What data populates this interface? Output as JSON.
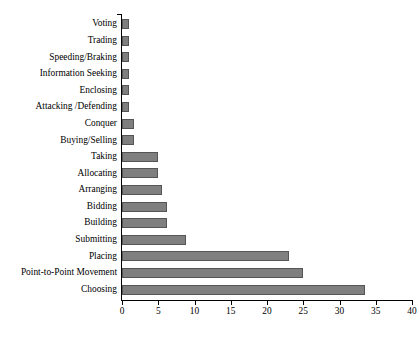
{
  "chart_data": {
    "type": "bar",
    "orientation": "horizontal",
    "title": "",
    "subtitle": "",
    "xlabel": "",
    "ylabel": "",
    "xlim": [
      0,
      40
    ],
    "ylim": null,
    "grid": false,
    "legend": null,
    "legend_position": "none",
    "xticks": [
      0,
      5,
      10,
      15,
      20,
      25,
      30,
      35,
      40
    ],
    "bar_color": "#7f7f7f",
    "bar_border_color": "#555555",
    "axis_color": "#000000",
    "background": "#ffffff",
    "categories": [
      "Voting",
      "Trading",
      "Speeding/Braking",
      "Information Seeking",
      "Enclosing",
      "Attacking /Defending",
      "Conquer",
      "Buying/Selling",
      "Taking",
      "Allocating",
      "Arranging",
      "Bidding",
      "Building",
      "Submitting",
      "Placing",
      "Point-to-Point Movement",
      "Choosing"
    ],
    "values": [
      1,
      1,
      1,
      1,
      1,
      1,
      1.6,
      1.6,
      5,
      5,
      5.5,
      6.2,
      6.2,
      8.8,
      23,
      25,
      33.5
    ]
  }
}
